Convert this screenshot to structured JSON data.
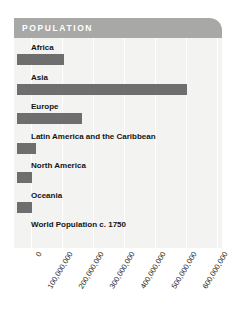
{
  "panel": {
    "title": "POPULATION",
    "header_color": "#a8a8a6",
    "background_color": "#f3f3f1",
    "bar_color": "#6e6e6e",
    "gridline_color": "#ffffff",
    "label_color": "#141414"
  },
  "chart_data": {
    "type": "bar",
    "orientation": "horizontal",
    "title": "POPULATION",
    "xlabel": "",
    "ylabel": "",
    "categories": [
      "Africa",
      "Asia",
      "Europe",
      "Latin America and the Caribbean",
      "North America",
      "Oceania",
      "World Population c. 1750"
    ],
    "values": [
      106000000,
      502000000,
      163000000,
      16000000,
      2000000,
      2000000,
      null
    ],
    "xlim": [
      0,
      680000000
    ],
    "tick_values": [
      0,
      100000000,
      200000000,
      300000000,
      400000000,
      500000000,
      600000000
    ],
    "tick_labels": [
      "0",
      "100,000,000",
      "200,000,000",
      "300,000,000",
      "400,000,000",
      "500,000,000",
      "600,000,000"
    ],
    "grid": true,
    "grid_axis": "x",
    "legend": false
  }
}
